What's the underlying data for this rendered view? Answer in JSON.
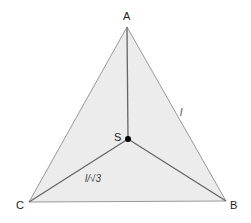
{
  "diagram": {
    "title": "",
    "vertices": [
      {
        "id": "A",
        "label": "A",
        "x": 127,
        "y": 27
      },
      {
        "id": "B",
        "label": "B",
        "x": 226,
        "y": 201
      },
      {
        "id": "C",
        "label": "C",
        "x": 29,
        "y": 202
      }
    ],
    "center": {
      "id": "S",
      "label": "S",
      "x": 128,
      "y": 139
    },
    "edge_label": "l",
    "spoke_label": "l/√3",
    "colors": {
      "fill": "#ececec",
      "outer_edge": "#9a9a9a",
      "spoke": "#666666",
      "point": "#000000"
    }
  }
}
